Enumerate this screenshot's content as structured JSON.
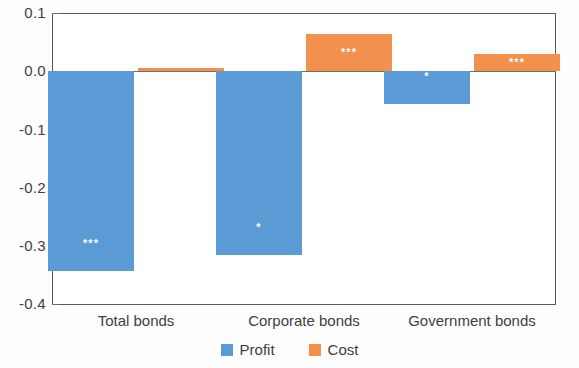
{
  "chart_data": {
    "type": "bar",
    "title": "",
    "subtitle": "",
    "xlabel": "",
    "ylabel": "",
    "categories": [
      "Total bonds",
      "Corporate bonds",
      "Government bonds"
    ],
    "series": [
      {
        "name": "Profit",
        "color": "#5b9bd5",
        "values": [
          -0.342,
          -0.315,
          -0.055
        ],
        "annotations": [
          "***",
          "*",
          "*"
        ]
      },
      {
        "name": "Cost",
        "color": "#f2914e",
        "values": [
          0.005,
          0.064,
          0.03
        ],
        "annotations": [
          "",
          "***",
          "***"
        ]
      }
    ],
    "ylim": [
      -0.4,
      0.1
    ],
    "yticks": [
      0.1,
      0.0,
      -0.1,
      -0.2,
      -0.3,
      -0.4
    ],
    "ytick_labels": [
      "0.1",
      "0.0",
      "-0.1",
      "-0.2",
      "-0.3",
      "-0.4"
    ],
    "grid": false,
    "zero_line": true,
    "legend_position": "bottom",
    "legend": [
      "Profit",
      "Cost"
    ]
  },
  "axis": {
    "y_labels": [
      "0.1",
      "0.0",
      "-0.1",
      "-0.2",
      "-0.3",
      "-0.4"
    ],
    "x_labels": [
      "Total bonds",
      "Corporate bonds",
      "Government bonds"
    ]
  },
  "legend": {
    "items": [
      {
        "label": "Profit",
        "color": "#5b9bd5",
        "swatch": "profit-swatch-icon"
      },
      {
        "label": "Cost",
        "color": "#f2914e",
        "swatch": "cost-swatch-icon"
      }
    ]
  },
  "bars": [
    {
      "group": "Total bonds",
      "series": "Profit",
      "value": -0.342,
      "stars": "***"
    },
    {
      "group": "Total bonds",
      "series": "Cost",
      "value": 0.005,
      "stars": ""
    },
    {
      "group": "Corporate bonds",
      "series": "Profit",
      "value": -0.315,
      "stars": "*"
    },
    {
      "group": "Corporate bonds",
      "series": "Cost",
      "value": 0.064,
      "stars": "***"
    },
    {
      "group": "Government bonds",
      "series": "Profit",
      "value": -0.055,
      "stars": "*"
    },
    {
      "group": "Government bonds",
      "series": "Cost",
      "value": 0.03,
      "stars": "***"
    }
  ]
}
